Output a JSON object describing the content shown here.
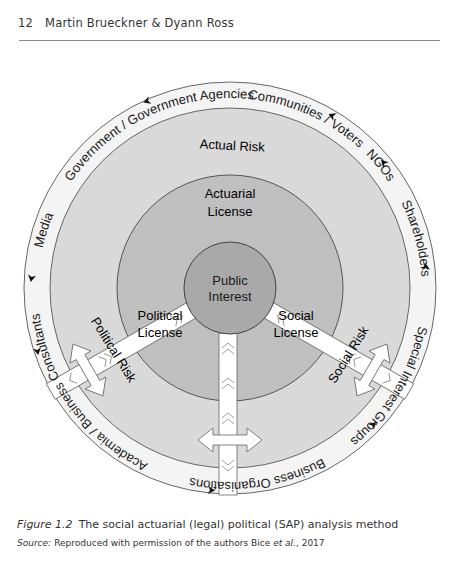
{
  "running_head": {
    "page_number": "12",
    "authors": "Martin Brueckner & Dyann Ross"
  },
  "figure": {
    "center_label": [
      "Public",
      "Interest"
    ],
    "licenses": {
      "actuarial": [
        "Actuarial",
        "License"
      ],
      "political": [
        "Political",
        "License"
      ],
      "social": [
        "Social",
        "License"
      ]
    },
    "risks": {
      "actual": "Actual Risk",
      "political": "Political Risk",
      "social": "Social Risk"
    },
    "stakeholders": {
      "communities": "Communities / Voters",
      "ngos": "NGOs",
      "shareholders": "Shareholders",
      "special_interest": "Special Interest Groups",
      "business_orgs": "Business Organisations",
      "academia": "Academia / Business Consultants",
      "media": "Media",
      "government": "Government / Government Agencies"
    },
    "colors": {
      "outer_ring": "#f2f2f2",
      "risk_zone": "#d9d9d9",
      "license_zone": "#bdbdbd",
      "center": "#a8a8a8",
      "stroke": "#555555"
    }
  },
  "caption": {
    "label": "Figure 1.2",
    "text": "The social actuarial (legal) political (SAP) analysis method"
  },
  "source": {
    "label": "Source:",
    "text": "Reproduced with permission of the authors Bice",
    "etal": "et al.",
    "year": ", 2017"
  }
}
